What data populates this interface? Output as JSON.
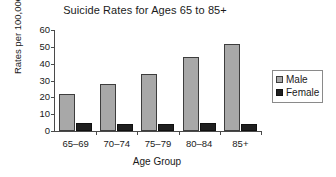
{
  "chart_data": {
    "type": "bar",
    "title": "Suicide Rates for Ages 65 to 85+",
    "xlabel": "Age Group",
    "ylabel": "Rates per 100,000",
    "categories": [
      "65–69",
      "70–74",
      "75–79",
      "80–84",
      "85+"
    ],
    "series": [
      {
        "name": "Male",
        "color": "#a8a8a8",
        "values": [
          22,
          28,
          34,
          44,
          51.5
        ]
      },
      {
        "name": "Female",
        "color": "#1f1f1f",
        "values": [
          4.5,
          4,
          4,
          4.5,
          4
        ]
      }
    ],
    "ylim": [
      0,
      60
    ],
    "yticks": [
      0,
      10,
      20,
      30,
      40,
      50,
      60
    ],
    "ytick_labels": [
      "0",
      "10",
      "20",
      "30",
      "40",
      "50",
      "60"
    ],
    "grid": false,
    "legend_position": "right-outside",
    "legend_entries": [
      "Male",
      "Female"
    ]
  }
}
